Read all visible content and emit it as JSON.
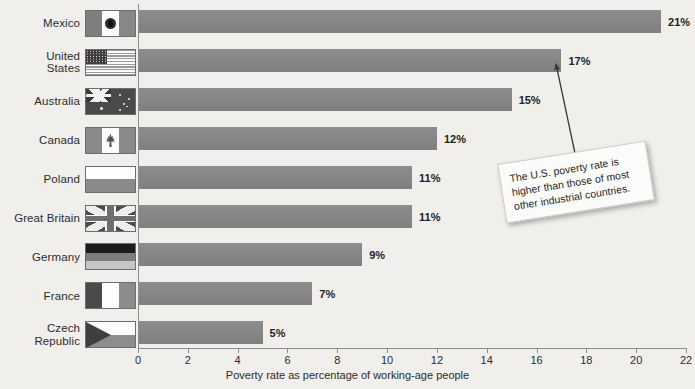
{
  "chart_data": {
    "type": "bar",
    "orientation": "horizontal",
    "title": "",
    "xlabel": "Poverty rate as percentage of working-age people",
    "ylabel": "",
    "xlim": [
      0,
      22
    ],
    "xticks": [
      0,
      2,
      4,
      6,
      8,
      10,
      12,
      14,
      16,
      18,
      20,
      22
    ],
    "grid": false,
    "legend": "none",
    "categories": [
      "Mexico",
      "United States",
      "Australia",
      "Canada",
      "Poland",
      "Great Britain",
      "Germany",
      "France",
      "Czech Republic"
    ],
    "values": [
      21,
      17,
      15,
      12,
      11,
      11,
      9,
      7,
      5
    ],
    "value_labels": [
      "21%",
      "17%",
      "15%",
      "12%",
      "11%",
      "11%",
      "9%",
      "7%",
      "5%"
    ],
    "annotations": [
      {
        "text": "The U.S. poverty rate is\nhigher than those of most\nother industrial countries.",
        "points_to": "United States"
      }
    ]
  },
  "rows": [
    {
      "label": "Mexico",
      "flag": "flag-mexico",
      "value": 21,
      "value_label": "21%"
    },
    {
      "label": "United\nStates",
      "flag": "flag-united-states",
      "value": 17,
      "value_label": "17%"
    },
    {
      "label": "Australia",
      "flag": "flag-australia",
      "value": 15,
      "value_label": "15%"
    },
    {
      "label": "Canada",
      "flag": "flag-canada",
      "value": 12,
      "value_label": "12%"
    },
    {
      "label": "Poland",
      "flag": "flag-poland",
      "value": 11,
      "value_label": "11%"
    },
    {
      "label": "Great Britain",
      "flag": "flag-great-britain",
      "value": 11,
      "value_label": "11%"
    },
    {
      "label": "Germany",
      "flag": "flag-germany",
      "value": 9,
      "value_label": "9%"
    },
    {
      "label": "France",
      "flag": "flag-france",
      "value": 7,
      "value_label": "7%"
    },
    {
      "label": "Czech Republic",
      "flag": "flag-czech-republic",
      "value": 5,
      "value_label": "5%"
    }
  ],
  "axis": {
    "ticks": [
      "0",
      "2",
      "4",
      "6",
      "8",
      "10",
      "12",
      "14",
      "16",
      "18",
      "20",
      "22"
    ],
    "title": "Poverty rate as percentage of working-age people"
  },
  "callout": {
    "text": "The U.S. poverty rate is\nhigher than those of most\nother industrial countries."
  },
  "colors": {
    "background": "#f0efec",
    "bar": "#868686",
    "axis": "#8d8d8d",
    "text": "#2c2c2c",
    "callout_bg": "#fbfbfa"
  }
}
